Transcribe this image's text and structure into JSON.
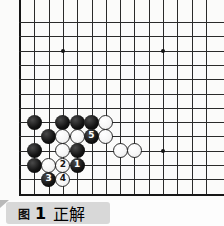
{
  "figure": {
    "caption_label": "图",
    "caption_number": "1",
    "caption_title": "正解",
    "caption_full": "图 1  正解"
  },
  "board": {
    "type": "go-board-diagram",
    "visible_columns": 14,
    "visible_rows": 13,
    "origin_px": {
      "x": 20,
      "y": 22
    },
    "cell_px": 14.3,
    "line_color": "#2a2a2a",
    "edge_color": "#161616",
    "background_color": "#fbfbfa",
    "star_points": [
      {
        "col": 3,
        "row": 2
      },
      {
        "col": 10,
        "row": 2
      },
      {
        "col": 10,
        "row": 9
      }
    ],
    "stones": [
      {
        "color": "black",
        "col": 1,
        "row": 7,
        "label": ""
      },
      {
        "color": "black",
        "col": 3,
        "row": 7,
        "label": ""
      },
      {
        "color": "black",
        "col": 4,
        "row": 7,
        "label": ""
      },
      {
        "color": "black",
        "col": 5,
        "row": 7,
        "label": ""
      },
      {
        "color": "white",
        "col": 6,
        "row": 7,
        "label": ""
      },
      {
        "color": "black",
        "col": 2,
        "row": 8,
        "label": ""
      },
      {
        "color": "white",
        "col": 3,
        "row": 8,
        "label": ""
      },
      {
        "color": "white",
        "col": 4,
        "row": 8,
        "label": ""
      },
      {
        "color": "black",
        "col": 5,
        "row": 8,
        "label": "5"
      },
      {
        "color": "white",
        "col": 6,
        "row": 8,
        "label": ""
      },
      {
        "color": "black",
        "col": 1,
        "row": 9,
        "label": ""
      },
      {
        "color": "white",
        "col": 3,
        "row": 9,
        "label": ""
      },
      {
        "color": "black",
        "col": 4,
        "row": 9,
        "label": ""
      },
      {
        "color": "white",
        "col": 7,
        "row": 9,
        "label": ""
      },
      {
        "color": "white",
        "col": 8,
        "row": 9,
        "label": ""
      },
      {
        "color": "black",
        "col": 1,
        "row": 10,
        "label": ""
      },
      {
        "color": "white",
        "col": 2,
        "row": 10,
        "label": ""
      },
      {
        "color": "white",
        "col": 3,
        "row": 10,
        "label": "2"
      },
      {
        "color": "black",
        "col": 4,
        "row": 10,
        "label": "1"
      },
      {
        "color": "black",
        "col": 2,
        "row": 11,
        "label": "3"
      },
      {
        "color": "white",
        "col": 3,
        "row": 11,
        "label": "4"
      }
    ],
    "move_sequence": [
      {
        "number": "1",
        "color": "black"
      },
      {
        "number": "2",
        "color": "white"
      },
      {
        "number": "3",
        "color": "black"
      },
      {
        "number": "4",
        "color": "white"
      },
      {
        "number": "5",
        "color": "black"
      }
    ]
  }
}
